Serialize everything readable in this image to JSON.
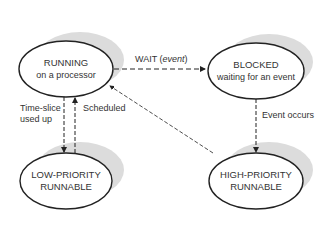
{
  "diagram": {
    "type": "state-transition",
    "states": [
      {
        "id": "running",
        "title": "RUNNING",
        "subtitle": "on a processor"
      },
      {
        "id": "blocked",
        "title": "BLOCKED",
        "subtitle": "waiting for an event"
      },
      {
        "id": "low",
        "title": "LOW-PRIORITY",
        "subtitle": "RUNNABLE"
      },
      {
        "id": "high",
        "title": "HIGH-PRIORITY",
        "subtitle": "RUNNABLE"
      }
    ],
    "transitions": [
      {
        "from": "running",
        "to": "blocked",
        "label": "WAIT (",
        "label_italic": "event",
        "label_end": ")"
      },
      {
        "from": "running",
        "to": "low",
        "label_line1": "Time-slice",
        "label_line2": "used up"
      },
      {
        "from": "low",
        "to": "running",
        "label": "Scheduled"
      },
      {
        "from": "blocked",
        "to": "high",
        "label": "Event occurs"
      },
      {
        "from": "high",
        "to": "running",
        "label": ""
      }
    ],
    "colors": {
      "stroke": "#222222",
      "shadow": "#dcdcdc",
      "text": "#333333"
    }
  }
}
